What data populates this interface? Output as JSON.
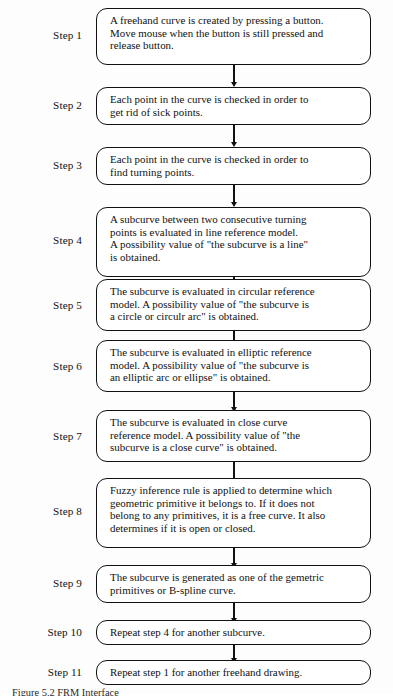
{
  "figure": {
    "type": "flowchart",
    "orientation": "vertical",
    "caption": "Figure 5.2  FRM Interface",
    "connector_count": 10
  },
  "steps": [
    {
      "label": "Step 1",
      "text": "A freehand curve is created by pressing a button.\nMove mouse when the button is still pressed and\nrelease button.",
      "lines": 3
    },
    {
      "label": "Step 2",
      "text": "Each point in the curve is checked in order to\nget rid of sick points.",
      "lines": 2
    },
    {
      "label": "Step 3",
      "text": "Each point in the curve is checked in order to\nfind turning points.",
      "lines": 2
    },
    {
      "label": "Step 4",
      "text": "A  subcurve between two consecutive turning\npoints is evaluated in line reference model.\nA possibility value of  \"the subcurve is a line\"\nis obtained.",
      "lines": 4
    },
    {
      "label": "Step 5",
      "text": "The subcurve is evaluated in circular reference\nmodel.  A possibility value of  \"the subcurve is\na circle or circulr arc\" is obtained.",
      "lines": 3
    },
    {
      "label": "Step 6",
      "text": "The subcurve is evaluated in elliptic reference\nmodel.  A possibility value of  \"the subcurve is\nan elliptic arc or ellipse\"  is obtained.",
      "lines": 3
    },
    {
      "label": "Step 7",
      "text": "The subcurve is evaluated in close curve\nreference model.  A possibility value of  \"the\nsubcurve is a close curve\"  is obtained.",
      "lines": 3
    },
    {
      "label": "Step 8",
      "text": "Fuzzy inference rule is applied to determine which\ngeometric primitive it belongs to.  If  it does not\nbelong to any primitives, it is a free curve.  It also\ndetermines if it is open or closed.",
      "lines": 4
    },
    {
      "label": "Step 9",
      "text": "The subcurve is generated as one of the gemetric\nprimitives or B-spline curve.",
      "lines": 2
    },
    {
      "label": "Step 10",
      "text": "Repeat step 4 for another subcurve.",
      "lines": 1
    },
    {
      "label": "Step 11",
      "text": "Repeat step 1 for another freehand drawing.",
      "lines": 1
    }
  ],
  "colors": {
    "background": "#fdfdfd",
    "ink": "#111111",
    "box_fill": "#ffffff"
  }
}
